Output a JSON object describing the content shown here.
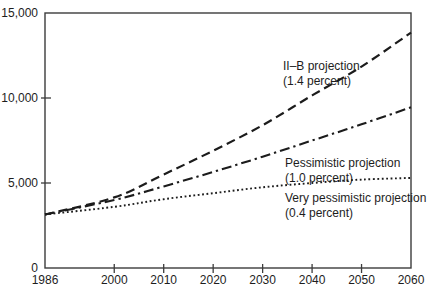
{
  "figure": {
    "background": "#ffffff",
    "axis_color": "#3c3c3c",
    "text_color": "#1d1d1d",
    "line_color": "#1c1c1c"
  },
  "chart_data": {
    "type": "line",
    "title": "",
    "xlabel": "",
    "ylabel": "",
    "grid": false,
    "legend_position": "inline-annotations",
    "xlim": [
      1986,
      2060
    ],
    "ylim": [
      0,
      15000
    ],
    "x": [
      1986,
      2000,
      2010,
      2020,
      2030,
      2040,
      2050,
      2060
    ],
    "xticks": [
      1986,
      2000,
      2010,
      2020,
      2030,
      2040,
      2050,
      2060
    ],
    "xtick_labels": [
      "1986",
      "2000",
      "2010",
      "2020",
      "2030",
      "2040",
      "2050",
      "2060"
    ],
    "yticks": [
      0,
      5000,
      10000,
      15000
    ],
    "ytick_labels": [
      "0",
      "5,000",
      "10,000",
      "15,000"
    ],
    "series": [
      {
        "name": "II–B projection",
        "rate_label": "(1.4 percent)",
        "style": "dashed",
        "color": "#1c1c1c",
        "values": [
          3150,
          4150,
          5500,
          6900,
          8400,
          10150,
          11850,
          13850
        ],
        "annotation": {
          "lines": [
            "II–B projection",
            "(1.4 percent)"
          ],
          "x_px": 283,
          "y_px": 70,
          "line_gap_px": 15
        }
      },
      {
        "name": "Pessimistic projection",
        "rate_label": "(1.0 percent)",
        "style": "dashdot",
        "color": "#1c1c1c",
        "values": [
          3150,
          4000,
          4800,
          5650,
          6550,
          7500,
          8450,
          9450
        ],
        "annotation": {
          "lines": [
            "Pessimistic projection",
            "(1.0 percent)"
          ],
          "x_px": 285,
          "y_px": 167,
          "line_gap_px": 15
        }
      },
      {
        "name": "Very pessimistic projection",
        "rate_label": "(0.4 percent)",
        "style": "dotted",
        "color": "#1c1c1c",
        "values": [
          3150,
          3600,
          4050,
          4400,
          4750,
          5000,
          5200,
          5300
        ],
        "annotation": {
          "lines": [
            "Very pessimistic projection",
            "(0.4 percent)"
          ],
          "x_px": 285,
          "y_px": 202,
          "line_gap_px": 15
        }
      }
    ]
  }
}
